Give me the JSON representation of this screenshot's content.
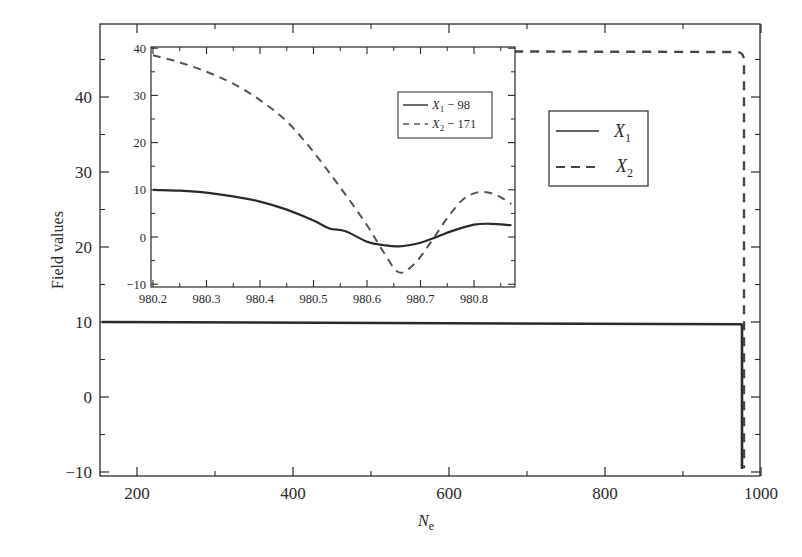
{
  "chart_data": [
    {
      "id": "main",
      "type": "line",
      "title": "",
      "xlabel": "N",
      "xlabel_sub": "e",
      "ylabel": "Field values",
      "xlim": [
        155,
        1005
      ],
      "ylim": [
        -10.5,
        49
      ],
      "xticks": [
        200,
        400,
        600,
        800,
        1000
      ],
      "xminor": [
        300,
        500,
        700,
        900
      ],
      "yticks": [
        -10,
        0,
        10,
        20,
        30,
        40
      ],
      "yminor": [
        -5,
        5,
        15,
        25,
        35,
        45
      ],
      "grid": false,
      "legend": {
        "position": "upper-right-inside",
        "entries": [
          {
            "label": "X",
            "sub": "1",
            "style": "solid"
          },
          {
            "label": "X",
            "sub": "2",
            "style": "dashed"
          }
        ]
      },
      "series": [
        {
          "name": "X1",
          "style": "solid",
          "color": "#2a2a2a",
          "x": [
            155,
            400,
            600,
            800,
            978,
            979.5,
            980,
            980.5,
            981
          ],
          "y": [
            10,
            10,
            9.9,
            9.8,
            9.7,
            9.7,
            5,
            0,
            -9.5
          ]
        },
        {
          "name": "X2",
          "style": "dashed",
          "color": "#444444",
          "x": [
            540,
            700,
            900,
            975,
            978,
            980,
            980.5,
            981
          ],
          "y": [
            46.1,
            46.1,
            46.0,
            45.8,
            45.0,
            40,
            20,
            -9.5
          ]
        }
      ]
    },
    {
      "id": "inset",
      "type": "line",
      "xlabel": "",
      "ylabel": "",
      "xlim": [
        980.195,
        980.87
      ],
      "ylim": [
        -10,
        40
      ],
      "xticks": [
        980.2,
        980.3,
        980.4,
        980.5,
        980.6,
        980.7,
        980.8
      ],
      "yticks": [
        -10,
        0,
        10,
        20,
        30,
        40
      ],
      "legend": {
        "position": "upper-right",
        "entries": [
          {
            "label": "X",
            "sub": "1",
            "suffix": " − 98",
            "style": "solid"
          },
          {
            "label": "X",
            "sub": "2",
            "suffix": " − 171",
            "style": "dashed"
          }
        ]
      },
      "series": [
        {
          "name": "X1 - 98",
          "style": "solid",
          "color": "#2a2a2a",
          "x": [
            980.2,
            980.25,
            980.3,
            980.35,
            980.4,
            980.45,
            980.5,
            980.53,
            980.56,
            980.6,
            980.63,
            980.66,
            980.7,
            980.73,
            980.76,
            980.8,
            980.83,
            980.87
          ],
          "y": [
            10,
            9.8,
            9.4,
            8.6,
            7.5,
            5.8,
            3.5,
            1.8,
            1.2,
            -1,
            -1.7,
            -2,
            -1.2,
            0,
            1.3,
            2.6,
            2.8,
            2.5
          ]
        },
        {
          "name": "X2 - 171",
          "style": "dashed",
          "color": "#555555",
          "x": [
            980.2,
            980.25,
            980.3,
            980.35,
            980.4,
            980.45,
            980.5,
            980.55,
            980.6,
            980.63,
            980.66,
            980.69,
            980.72,
            980.75,
            980.78,
            980.81,
            980.84,
            980.87
          ],
          "y": [
            38.5,
            37,
            35,
            32.5,
            29,
            24.5,
            18,
            10.5,
            2.5,
            -3,
            -7.5,
            -5.5,
            -1,
            4,
            8,
            9.5,
            9,
            7
          ]
        }
      ]
    }
  ]
}
